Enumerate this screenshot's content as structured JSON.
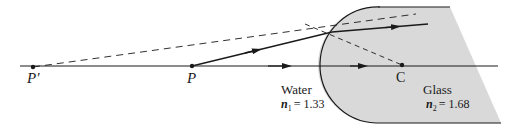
{
  "diagram": {
    "points": {
      "p_prime": {
        "label": "P′",
        "x": 33,
        "y": 67
      },
      "p": {
        "label": "P",
        "x": 192,
        "y": 66
      },
      "c": {
        "label": "C",
        "x": 402,
        "y": 65
      }
    },
    "media": {
      "water": {
        "name": "Water",
        "index_symbol": "n",
        "index_subscript": "1",
        "index_value": "= 1.33"
      },
      "glass": {
        "name": "Glass",
        "index_symbol": "n",
        "index_subscript": "2",
        "index_value": "= 1.68"
      }
    },
    "colors": {
      "line": "#1a1a1a",
      "glass_fill": "#d9d9d9",
      "background": "#ffffff"
    }
  }
}
